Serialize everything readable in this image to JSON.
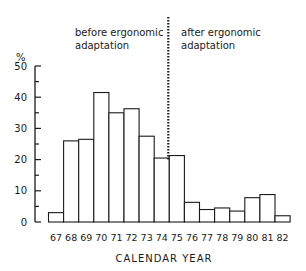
{
  "chart_data": {
    "type": "bar",
    "title": "",
    "xlabel": "CALENDAR YEAR",
    "ylabel": "%",
    "ylim": [
      0,
      50
    ],
    "yticks": [
      0,
      10,
      20,
      30,
      40,
      50
    ],
    "grid": false,
    "categories": [
      "67",
      "68",
      "69",
      "70",
      "71",
      "72",
      "73",
      "74",
      "75",
      "76",
      "77",
      "78",
      "79",
      "80",
      "81",
      "82"
    ],
    "values": [
      3,
      26,
      26.5,
      41.5,
      35,
      36.3,
      27.5,
      20.5,
      21.3,
      6.3,
      4,
      4.5,
      3.5,
      7.8,
      8.8,
      2
    ],
    "divider_after_category": "74",
    "annotations": [
      {
        "text": [
          "before ergonomic",
          "adaptation"
        ],
        "position": "left of divider"
      },
      {
        "text": [
          "after ergonomic",
          "adaptation"
        ],
        "position": "right of divider"
      }
    ]
  },
  "labels": {
    "ylabel": "%",
    "xlabel": "CALENDAR YEAR",
    "before_line1": "before ergonomic",
    "before_line2": "adaptation",
    "after_line1": "after ergonomic",
    "after_line2": "adaptation"
  },
  "style": {
    "stroke": "#1a1a1a",
    "bar_fill": "#ffffff"
  }
}
